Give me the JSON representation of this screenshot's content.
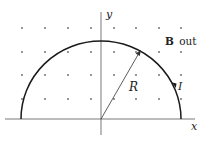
{
  "diagram": {
    "axes": {
      "x_label": "x",
      "y_label": "y"
    },
    "radius_label": "R",
    "current_label": "I",
    "field_label": {
      "vector": "B",
      "direction": "out"
    },
    "field_symbol": "dot-grid",
    "shape": "semicircular current loop",
    "colors": {
      "stroke": "#1a1a1a",
      "dots": "#666666",
      "text": "#222222"
    }
  }
}
